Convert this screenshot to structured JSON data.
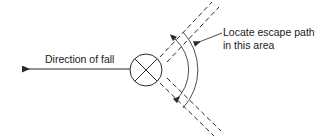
{
  "diagram": {
    "labels": {
      "direction_of_fall": "Direction of fall",
      "locate_escape_path_line1": "Locate escape path",
      "locate_escape_path_line2": "in this area"
    },
    "colors": {
      "line": "#2b2b2b",
      "thin_line": "#3a3a3a",
      "text": "#1a1a1a",
      "background": "#ffffff"
    },
    "geometry": {
      "circle_center_x": 146,
      "circle_center_y": 70,
      "circle_radius": 16,
      "fall_arrow_tip_x": 20,
      "fall_arrow_tip_y": 69,
      "fall_arrow_tail_x": 130,
      "upper_track_angle_deg": -52,
      "lower_track_angle_deg": 52,
      "arc_inner_radius": 42,
      "arc_outer_radius": 56
    }
  }
}
